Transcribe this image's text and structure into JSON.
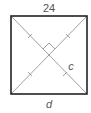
{
  "diagram": {
    "type": "square-with-diagonals",
    "labels": {
      "top": "24",
      "bottom": "d",
      "diagonal_segment": "c"
    },
    "marks": {
      "right_angle_at_center": true,
      "congruent_tick_marks": 4
    },
    "colors": {
      "outline": "#222222",
      "diagonals": "#777777",
      "text": "#555555"
    }
  }
}
